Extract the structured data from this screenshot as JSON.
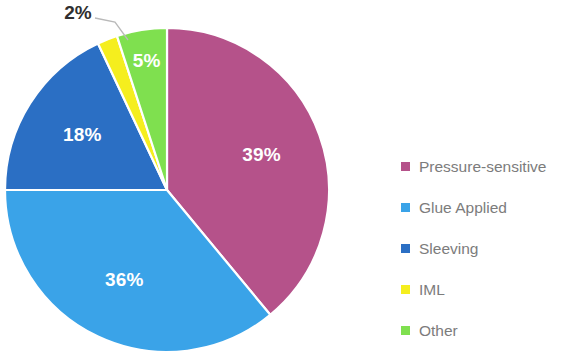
{
  "chart_data": {
    "type": "pie",
    "title": "",
    "subtitle": "",
    "xlabel": "",
    "ylabel": "",
    "grid": false,
    "legend_position": "right",
    "value_unit": "%",
    "start_angle_deg": 0,
    "direction": "clockwise",
    "categories": [
      "Pressure-sensitive",
      "Glue Applied",
      "Sleeving",
      "IML",
      "Other"
    ],
    "values": [
      39,
      36,
      18,
      2,
      5
    ],
    "labels": [
      "39%",
      "36%",
      "18%",
      "2%",
      "5%"
    ],
    "colors": [
      "#B5528A",
      "#3AA3E8",
      "#2B6FC4",
      "#F5EE1E",
      "#7FE04F"
    ],
    "label_colors": [
      "#FFFFFF",
      "#FFFFFF",
      "#FFFFFF",
      "#2F2F2F",
      "#FFFFFF"
    ],
    "label_placement": [
      "inside",
      "inside",
      "inside",
      "outside",
      "inside"
    ],
    "slices": [
      {
        "name": "Pressure-sensitive",
        "value": 39,
        "label": "39%",
        "color": "#B5528A",
        "label_color": "#FFFFFF",
        "placement": "inside"
      },
      {
        "name": "Glue Applied",
        "value": 36,
        "label": "36%",
        "color": "#3AA3E8",
        "label_color": "#FFFFFF",
        "placement": "inside"
      },
      {
        "name": "Sleeving",
        "value": 18,
        "label": "18%",
        "color": "#2B6FC4",
        "label_color": "#FFFFFF",
        "placement": "inside"
      },
      {
        "name": "IML",
        "value": 2,
        "label": "2%",
        "color": "#F5EE1E",
        "label_color": "#2F2F2F",
        "placement": "outside"
      },
      {
        "name": "Other",
        "value": 5,
        "label": "5%",
        "color": "#7FE04F",
        "label_color": "#FFFFFF",
        "placement": "inside"
      }
    ]
  },
  "pie": {
    "center_x": 167,
    "center_y": 190,
    "radius": 162,
    "labels": {
      "pressure_sensitive": "39%",
      "glue_applied": "36%",
      "sleeving": "18%",
      "iml": "2%",
      "other": "5%"
    }
  },
  "legend": {
    "items": [
      {
        "label": "Pressure-sensitive",
        "color": "#B5528A"
      },
      {
        "label": "Glue Applied",
        "color": "#3AA3E8"
      },
      {
        "label": "Sleeving",
        "color": "#2B6FC4"
      },
      {
        "label": "IML",
        "color": "#F5EE1E"
      },
      {
        "label": "Other",
        "color": "#7FE04F"
      }
    ]
  },
  "theme": {
    "background": "#FFFFFF",
    "legend_text_color": "#7C7C7C",
    "slice_border_color": "#FFFFFF",
    "callout_line_color": "#B9B9B9"
  }
}
